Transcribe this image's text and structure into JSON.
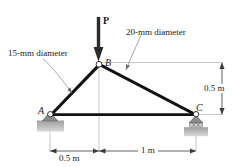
{
  "figure": {
    "load_label": "P",
    "joints": [
      {
        "id": "A",
        "label": "A",
        "x": 0.0,
        "y": 0.0,
        "support": "pin"
      },
      {
        "id": "B",
        "label": "B",
        "x": 0.5,
        "y": 0.5,
        "support": "none"
      },
      {
        "id": "C",
        "label": "C",
        "x": 1.5,
        "y": 0.0,
        "support": "roller"
      }
    ],
    "members": [
      {
        "from": "A",
        "to": "B",
        "note": "15-mm diameter"
      },
      {
        "from": "B",
        "to": "C",
        "note": "20-mm diameter"
      },
      {
        "from": "A",
        "to": "C",
        "note": ""
      }
    ],
    "annotations": {
      "member_ab_note": "15-mm diameter",
      "member_bc_note": "20-mm diameter"
    },
    "dimensions": {
      "horizontal_left": "0.5 m",
      "horizontal_right": "1 m",
      "vertical_right": "0.5 m"
    },
    "colors": {
      "member": "#111111",
      "support_fill": "#8c8c8c",
      "ground_hatch": "#b4b4b4",
      "dimension_line": "#3c3c3c",
      "extension_line": "#b0b0b0",
      "leader_line": "#8a8a8a",
      "text": "#1a1a1a",
      "arrow": "#222222"
    }
  }
}
